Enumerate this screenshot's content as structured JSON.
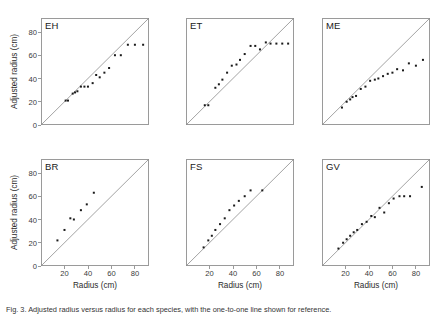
{
  "figure": {
    "caption": "Fig. 3. Adjusted radius versus radius for each species, with the one-to-one line shown for reference.",
    "axis_titles": {
      "x": "Radius (cm)",
      "y": "Adjusted radius (cm)"
    },
    "marker_color": "#1a1a1a",
    "line_color": "#8c8c8c",
    "frame_color": "#9a9a9a"
  },
  "chart_data": [
    {
      "type": "scatter",
      "title": "EH",
      "xlabel": "Radius (cm)",
      "ylabel": "Adjusted radius (cm)",
      "xlim": [
        0,
        92
      ],
      "ylim": [
        0,
        92
      ],
      "xticks": [
        0,
        20,
        40,
        60,
        80
      ],
      "yticks": [
        0,
        20,
        40,
        60,
        80
      ],
      "grid": false,
      "reference_line": {
        "type": "one-to-one",
        "from": [
          0,
          0
        ],
        "to": [
          92,
          92
        ]
      },
      "x": [
        21,
        23,
        27,
        29,
        31,
        34,
        37,
        40,
        44,
        47,
        50,
        54,
        58,
        63,
        68,
        74,
        80,
        87
      ],
      "y": [
        21,
        21,
        27,
        28,
        29,
        33,
        33,
        33,
        36,
        43,
        41,
        45,
        49,
        60,
        60,
        69,
        69,
        69
      ]
    },
    {
      "type": "scatter",
      "title": "ET",
      "xlabel": "Radius (cm)",
      "ylabel": "",
      "xlim": [
        0,
        92
      ],
      "ylim": [
        0,
        92
      ],
      "xticks": [
        0,
        20,
        40,
        60,
        80
      ],
      "yticks": [
        0,
        20,
        40,
        60,
        80
      ],
      "grid": false,
      "reference_line": {
        "type": "one-to-one",
        "from": [
          0,
          0
        ],
        "to": [
          92,
          92
        ]
      },
      "x": [
        16,
        19,
        25,
        28,
        31,
        35,
        39,
        43,
        46,
        50,
        55,
        59,
        63,
        68,
        72,
        77,
        82,
        87
      ],
      "y": [
        17,
        17,
        32,
        35,
        39,
        45,
        51,
        52,
        56,
        61,
        68,
        68,
        65,
        71,
        70,
        70,
        70,
        70
      ]
    },
    {
      "type": "scatter",
      "title": "ME",
      "xlabel": "Radius (cm)",
      "ylabel": "",
      "xlim": [
        0,
        92
      ],
      "ylim": [
        0,
        92
      ],
      "xticks": [
        0,
        20,
        40,
        60,
        80
      ],
      "yticks": [
        0,
        20,
        40,
        60,
        80
      ],
      "grid": false,
      "reference_line": {
        "type": "one-to-one",
        "from": [
          0,
          0
        ],
        "to": [
          92,
          92
        ]
      },
      "x": [
        17,
        21,
        24,
        26,
        29,
        33,
        37,
        41,
        45,
        48,
        52,
        56,
        60,
        64,
        69,
        74,
        80,
        86
      ],
      "y": [
        15,
        20,
        22,
        24,
        25,
        31,
        33,
        38,
        39,
        40,
        42,
        44,
        45,
        48,
        47,
        53,
        51,
        56
      ]
    },
    {
      "type": "scatter",
      "title": "BR",
      "xlabel": "Radius (cm)",
      "ylabel": "Adjusted radius (cm)",
      "xlim": [
        0,
        92
      ],
      "ylim": [
        0,
        92
      ],
      "xticks": [
        0,
        20,
        40,
        60,
        80
      ],
      "yticks": [
        0,
        20,
        40,
        60,
        80
      ],
      "grid": false,
      "reference_line": {
        "type": "one-to-one",
        "from": [
          0,
          0
        ],
        "to": [
          92,
          92
        ]
      },
      "x": [
        14,
        20,
        25,
        28,
        34,
        39,
        45
      ],
      "y": [
        22,
        31,
        41,
        40,
        48,
        53,
        63
      ]
    },
    {
      "type": "scatter",
      "title": "FS",
      "xlabel": "Radius (cm)",
      "ylabel": "",
      "xlim": [
        0,
        92
      ],
      "ylim": [
        0,
        92
      ],
      "xticks": [
        0,
        20,
        40,
        60,
        80
      ],
      "yticks": [
        0,
        20,
        40,
        60,
        80
      ],
      "grid": false,
      "reference_line": {
        "type": "one-to-one",
        "from": [
          0,
          0
        ],
        "to": [
          92,
          92
        ]
      },
      "x": [
        15,
        19,
        22,
        25,
        29,
        33,
        37,
        41,
        45,
        50,
        55,
        65
      ],
      "y": [
        16,
        22,
        26,
        31,
        36,
        41,
        48,
        52,
        56,
        60,
        65,
        65
      ]
    },
    {
      "type": "scatter",
      "title": "GV",
      "xlabel": "Radius (cm)",
      "ylabel": "",
      "xlim": [
        0,
        92
      ],
      "ylim": [
        0,
        92
      ],
      "xticks": [
        0,
        20,
        40,
        60,
        80
      ],
      "yticks": [
        0,
        20,
        40,
        60,
        80
      ],
      "grid": false,
      "reference_line": {
        "type": "one-to-one",
        "from": [
          0,
          0
        ],
        "to": [
          92,
          92
        ]
      },
      "x": [
        14,
        18,
        21,
        24,
        27,
        30,
        34,
        38,
        42,
        45,
        49,
        53,
        57,
        61,
        66,
        70,
        75,
        85
      ],
      "y": [
        15,
        20,
        23,
        26,
        29,
        31,
        36,
        38,
        43,
        42,
        50,
        46,
        54,
        58,
        60,
        60,
        60,
        68
      ]
    }
  ]
}
